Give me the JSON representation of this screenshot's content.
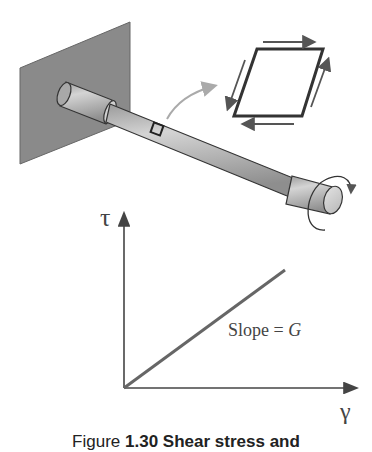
{
  "figure": {
    "element_label": "Stress element (sheared square)",
    "graph": {
      "y_axis_label": "τ",
      "x_axis_label": "γ",
      "slope_label_prefix": "Slope = ",
      "slope_label_symbol": "G"
    },
    "caption": {
      "lead": "Figure",
      "number": "1.30",
      "text": "Shear stress and"
    }
  },
  "colors": {
    "wall": "#8a8a8a",
    "rod": "#b4b4b4",
    "outline": "#333333",
    "arrow": "#555555",
    "pointer_arrow": "#aaaaaa",
    "plot_line": "#666666"
  }
}
